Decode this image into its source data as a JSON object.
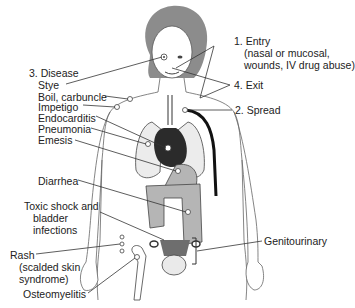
{
  "diagram": {
    "type": "anatomical-infection-pathway",
    "stages": {
      "entry": {
        "label": "1. Entry",
        "detail_line1": "(nasal or mucosal,",
        "detail_line2": "wounds, IV drug abuse)"
      },
      "spread": {
        "label": "2. Spread"
      },
      "disease": {
        "label": "3. Disease"
      },
      "exit": {
        "label": "4. Exit"
      }
    },
    "diseases": [
      {
        "label": "Stye"
      },
      {
        "label": "Boil, carbuncle"
      },
      {
        "label": "Impetigo"
      },
      {
        "label": "Endocarditis"
      },
      {
        "label": "Pneumonia"
      },
      {
        "label": "Emesis"
      },
      {
        "label": "Diarrhea"
      },
      {
        "label": "Toxic shock and",
        "line2": "bladder",
        "line3": "infections"
      },
      {
        "label": "Rash",
        "line2": "(scalded skin",
        "line3": "syndrome)"
      },
      {
        "label": "Osteomyelitis"
      },
      {
        "label": "Genitourinary"
      }
    ],
    "colors": {
      "hair": "#8c8c8c",
      "heart": "#2b2b2b",
      "organs": "#b5b5b5",
      "lungs": "#ececec",
      "uterus": "#6e6e6e",
      "outline": "#555555",
      "vessel": "#111111"
    }
  }
}
